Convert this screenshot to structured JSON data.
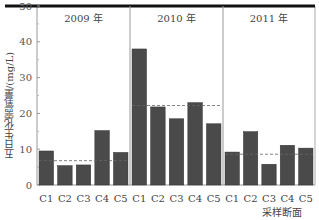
{
  "chart_data": {
    "type": "bar",
    "title": "",
    "xlabel": "采样断面",
    "ylabel": "五日生化需氧量/(mg/L)",
    "ylim": [
      0,
      50
    ],
    "yticks": [
      0,
      10,
      20,
      30,
      40,
      50
    ],
    "grid": false,
    "legend": null,
    "categories": [
      "C1",
      "C2",
      "C3",
      "C4",
      "C5"
    ],
    "groups": [
      {
        "name": "2009 年",
        "values": [
          9.5,
          5.4,
          5.6,
          15.2,
          9.1
        ],
        "mean_line": 6.8
      },
      {
        "name": "2010 年",
        "values": [
          38.0,
          21.8,
          18.5,
          23.0,
          17.1
        ],
        "mean_line": 22.2
      },
      {
        "name": "2011 年",
        "values": [
          9.2,
          14.9,
          5.8,
          11.1,
          10.3
        ],
        "mean_line": 8.6
      }
    ],
    "bar_color": "#4a4a4a",
    "mean_line_style": "dashed"
  }
}
